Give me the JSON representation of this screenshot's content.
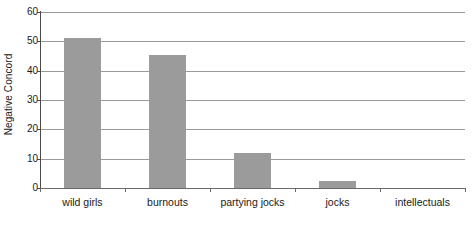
{
  "chart_data": {
    "type": "bar",
    "title": "",
    "subtitle": "",
    "xlabel": "",
    "ylabel": "Negative Concord",
    "categories": [
      "wild girls",
      "burnouts",
      "partying jocks",
      "jocks",
      "intellectuals"
    ],
    "values": [
      51,
      45.5,
      12,
      2.5,
      0
    ],
    "series": [
      {
        "name": "Negative Concord",
        "values": [
          51,
          45.5,
          12,
          2.5,
          0
        ]
      }
    ],
    "ylim": [
      0,
      60
    ],
    "yticks": [
      0,
      10,
      20,
      30,
      40,
      50,
      60
    ],
    "ytick_labels": [
      "0",
      "10",
      "20",
      "30",
      "40",
      "50",
      "60"
    ],
    "grid": "horizontal",
    "legend": "none",
    "annotations": [],
    "colors": {
      "bar_fill": "#9b9b9b",
      "gridline": "#9a9a9a",
      "axis_line": "#4a4a4a",
      "background": "#ffffff",
      "text": "#1a1a1a"
    }
  }
}
